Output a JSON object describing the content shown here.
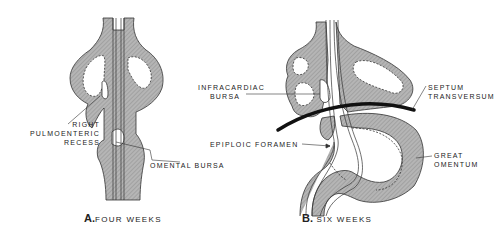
{
  "figure": {
    "panel_a": {
      "letter": "A.",
      "caption": "FOUR WEEKS",
      "labels": {
        "right_pulmoenteric_recess": [
          "RIGHT",
          "PULMOENTERIC",
          "RECESS"
        ],
        "omental_bursa": "OMENTAL BURSA"
      }
    },
    "panel_b": {
      "letter": "B.",
      "caption": "SIX WEEKS",
      "labels": {
        "infracardiac_bursa": [
          "INFRACARDIAC",
          "BURSA"
        ],
        "septum_transversum": [
          "SEPTUM",
          "TRANSVERSUM"
        ],
        "epiploic_foramen": "EPIPLOIC FORAMEN",
        "great_omentum": [
          "GREAT",
          "OMENTUM"
        ]
      }
    },
    "colors": {
      "tissue_fill": "#a9a9a9",
      "outline": "#333333",
      "background": "#ffffff"
    }
  }
}
